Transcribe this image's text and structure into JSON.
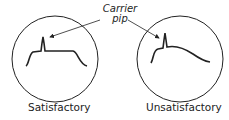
{
  "diagram": {
    "callout": {
      "line1": "Carrier",
      "line2": "pip"
    },
    "panels": [
      {
        "caption": "Satisfactory"
      },
      {
        "caption": "Unsatisfactory"
      }
    ],
    "colors": {
      "stroke": "#222222",
      "background": "#ffffff"
    }
  }
}
